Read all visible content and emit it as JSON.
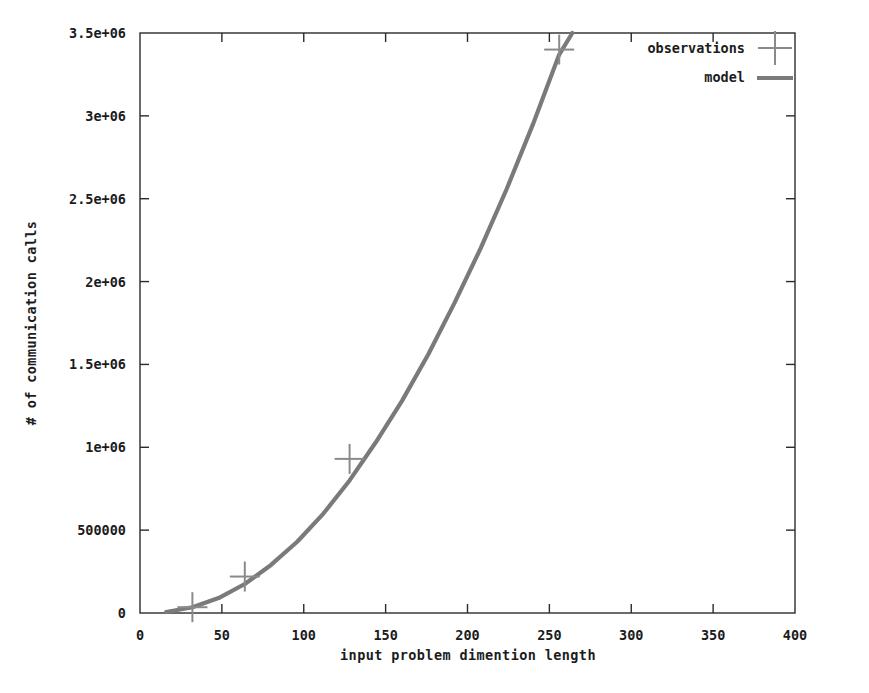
{
  "chart_data": {
    "type": "line",
    "title": "",
    "subtitle": "",
    "xlabel": "input problem dimention length",
    "ylabel": "# of communication calls",
    "xlim": [
      0,
      400
    ],
    "ylim": [
      0,
      3500000
    ],
    "xticks": [
      0,
      50,
      100,
      150,
      200,
      250,
      300,
      350,
      400
    ],
    "xtick_labels": [
      "0",
      "50",
      "100",
      "150",
      "200",
      "250",
      "300",
      "350",
      "400"
    ],
    "yticks": [
      0,
      500000,
      1000000,
      1500000,
      2000000,
      2500000,
      3000000,
      3500000
    ],
    "ytick_labels": [
      "0",
      "500000",
      "1e+06",
      "1.5e+06",
      "2e+06",
      "2.5e+06",
      "3e+06",
      "3.5e+06"
    ],
    "grid": false,
    "legend_position": "top-right",
    "series": [
      {
        "name": "observations",
        "style": "points",
        "marker": "plus",
        "color": "#8a8a8a",
        "x": [
          32,
          64,
          128,
          256
        ],
        "y": [
          35000,
          220000,
          930000,
          3400000
        ]
      },
      {
        "name": "model",
        "style": "line",
        "color": "#7a7a7a",
        "x": [
          16,
          32,
          48,
          64,
          80,
          96,
          112,
          128,
          144,
          160,
          176,
          192,
          208,
          224,
          240,
          256,
          264
        ],
        "y": [
          6000,
          35000,
          90000,
          175000,
          290000,
          430000,
          600000,
          800000,
          1030000,
          1280000,
          1560000,
          1870000,
          2200000,
          2560000,
          2950000,
          3370000,
          3500000
        ]
      }
    ]
  },
  "legend": {
    "entries": [
      {
        "label": "observations",
        "marker": "plus-marker"
      },
      {
        "label": "model",
        "marker": "line-sample"
      }
    ]
  },
  "axes": {
    "x_axis_title": "input problem dimention length",
    "y_axis_title": "# of communication calls"
  }
}
